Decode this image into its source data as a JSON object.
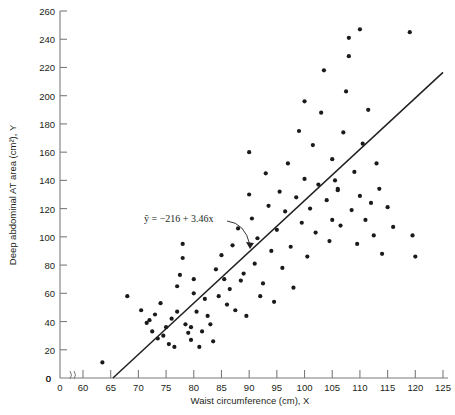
{
  "chart_data": {
    "type": "scatter",
    "title": "",
    "xlabel": "Waist circumference (cm), X",
    "ylabel": "Deep abdominal AT area (cm²), Y",
    "xlim": [
      60,
      125
    ],
    "ylim": [
      0,
      260
    ],
    "x_ticks": [
      0,
      60,
      65,
      70,
      75,
      80,
      85,
      90,
      95,
      100,
      105,
      110,
      115,
      120,
      125
    ],
    "y_ticks": [
      0,
      20,
      40,
      60,
      80,
      100,
      120,
      140,
      160,
      180,
      200,
      220,
      240,
      260
    ],
    "grid": false,
    "legend": "none",
    "axis_break": {
      "axis": "x",
      "between": [
        0,
        60
      ],
      "symbol": "zigzag"
    },
    "annotation": {
      "text": "ŷ = −216 + 3.46x",
      "x": 150,
      "y": 218,
      "arrow_to": [
        230,
        250
      ]
    },
    "regression_line": {
      "intercept": -216,
      "slope": 3.46,
      "x_start": 65.4,
      "x_end": 125.0,
      "y_start": 0,
      "y_end": 216.5,
      "color": "#231f20"
    },
    "marker": {
      "shape": "circle",
      "size": 3,
      "color": "#1a1a1a"
    },
    "points": [
      [
        63.5,
        11
      ],
      [
        68.0,
        58
      ],
      [
        70.5,
        48
      ],
      [
        71.5,
        39
      ],
      [
        72.0,
        41
      ],
      [
        72.5,
        33
      ],
      [
        73.0,
        45
      ],
      [
        73.5,
        28
      ],
      [
        74.0,
        53
      ],
      [
        74.5,
        30
      ],
      [
        75.0,
        36
      ],
      [
        75.5,
        24
      ],
      [
        76.0,
        42
      ],
      [
        76.5,
        22
      ],
      [
        77.0,
        47
      ],
      [
        77.0,
        65
      ],
      [
        77.5,
        73
      ],
      [
        78.0,
        85
      ],
      [
        78.0,
        95
      ],
      [
        78.5,
        38
      ],
      [
        79.0,
        32
      ],
      [
        79.5,
        27
      ],
      [
        79.5,
        36
      ],
      [
        80.0,
        70
      ],
      [
        80.0,
        60
      ],
      [
        80.5,
        47
      ],
      [
        81.0,
        22
      ],
      [
        81.5,
        33
      ],
      [
        82.0,
        56
      ],
      [
        82.5,
        44
      ],
      [
        83.0,
        38
      ],
      [
        83.5,
        26
      ],
      [
        84.0,
        77
      ],
      [
        84.5,
        58
      ],
      [
        85.0,
        87
      ],
      [
        85.5,
        70
      ],
      [
        86.0,
        52
      ],
      [
        86.5,
        63
      ],
      [
        87.0,
        94
      ],
      [
        87.5,
        48
      ],
      [
        88.0,
        106
      ],
      [
        88.5,
        69
      ],
      [
        89.0,
        74
      ],
      [
        89.5,
        44
      ],
      [
        90.0,
        130
      ],
      [
        90.0,
        160
      ],
      [
        90.5,
        113
      ],
      [
        91.0,
        81
      ],
      [
        91.5,
        99
      ],
      [
        92.0,
        58
      ],
      [
        92.5,
        67
      ],
      [
        93.0,
        145
      ],
      [
        93.5,
        122
      ],
      [
        94.0,
        90
      ],
      [
        94.5,
        54
      ],
      [
        95.0,
        105
      ],
      [
        95.5,
        132
      ],
      [
        96.0,
        78
      ],
      [
        96.5,
        118
      ],
      [
        97.0,
        152
      ],
      [
        97.5,
        93
      ],
      [
        98.0,
        64
      ],
      [
        98.5,
        128
      ],
      [
        99.0,
        175
      ],
      [
        99.5,
        110
      ],
      [
        100.0,
        141
      ],
      [
        100.0,
        196
      ],
      [
        100.5,
        86
      ],
      [
        101.0,
        120
      ],
      [
        101.5,
        165
      ],
      [
        102.0,
        103
      ],
      [
        102.5,
        137
      ],
      [
        103.0,
        188
      ],
      [
        103.5,
        218
      ],
      [
        104.0,
        126
      ],
      [
        104.5,
        97
      ],
      [
        105.0,
        155
      ],
      [
        105.0,
        112
      ],
      [
        105.5,
        140
      ],
      [
        106.0,
        133
      ],
      [
        106.0,
        134
      ],
      [
        106.5,
        108
      ],
      [
        107.0,
        174
      ],
      [
        107.5,
        203
      ],
      [
        108.0,
        228
      ],
      [
        108.0,
        241
      ],
      [
        108.5,
        119
      ],
      [
        109.0,
        146
      ],
      [
        109.5,
        95
      ],
      [
        110.0,
        247
      ],
      [
        110.0,
        129
      ],
      [
        110.5,
        166
      ],
      [
        111.0,
        112
      ],
      [
        111.5,
        190
      ],
      [
        112.0,
        124
      ],
      [
        112.5,
        101
      ],
      [
        113.0,
        152
      ],
      [
        113.5,
        134
      ],
      [
        114.0,
        88
      ],
      [
        115.0,
        121
      ],
      [
        116.0,
        107
      ],
      [
        119.0,
        245
      ],
      [
        119.5,
        101
      ],
      [
        120.0,
        86
      ]
    ]
  },
  "axes": {
    "x_axis_name": "x-axis",
    "y_axis_name": "y-axis",
    "origin_label": "0"
  }
}
